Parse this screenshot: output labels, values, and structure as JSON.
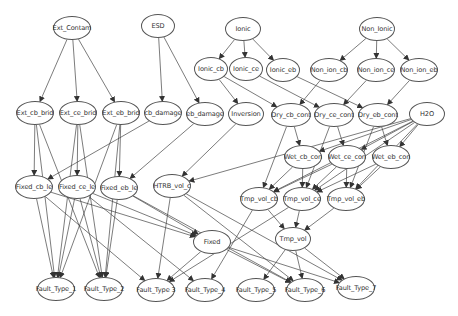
{
  "diagram": {
    "type": "directed-graph",
    "nodes": [
      {
        "id": "Ext_Contam",
        "label": "Ext_Contam",
        "x": 72,
        "y": 28,
        "w": 38,
        "h": 24
      },
      {
        "id": "ESD",
        "label": "ESD",
        "x": 158,
        "y": 26,
        "w": 34,
        "h": 24
      },
      {
        "id": "Ionic",
        "label": "Ionic",
        "x": 243,
        "y": 29,
        "w": 36,
        "h": 24
      },
      {
        "id": "Non_Ionic",
        "label": "Non_Ionic",
        "x": 377,
        "y": 29,
        "w": 36,
        "h": 24
      },
      {
        "id": "Ionic_cb",
        "label": "Ionic_cb",
        "x": 211,
        "y": 69,
        "w": 34,
        "h": 24
      },
      {
        "id": "Ionic_ce",
        "label": "Ionic_ce",
        "x": 246,
        "y": 69,
        "w": 34,
        "h": 24
      },
      {
        "id": "Ionic_eb",
        "label": "Ionic_eb",
        "x": 283,
        "y": 70,
        "w": 34,
        "h": 24
      },
      {
        "id": "Non_ion_cb",
        "label": "Non_ion_cb",
        "x": 329,
        "y": 70,
        "w": 38,
        "h": 24
      },
      {
        "id": "Non_ion_ce",
        "label": "Non_ion_ce",
        "x": 376,
        "y": 70,
        "w": 38,
        "h": 24
      },
      {
        "id": "Non_ion_eb",
        "label": "Non_ion_eb",
        "x": 419,
        "y": 70,
        "w": 38,
        "h": 24
      },
      {
        "id": "Ext_cb_brid",
        "label": "Ext_cb_brid",
        "x": 35,
        "y": 113,
        "w": 38,
        "h": 24
      },
      {
        "id": "Ext_ce_brid",
        "label": "Ext_ce_brid",
        "x": 78,
        "y": 113,
        "w": 38,
        "h": 24
      },
      {
        "id": "Ext_eb_brid",
        "label": "Ext_eb_brid",
        "x": 121,
        "y": 113,
        "w": 38,
        "h": 24
      },
      {
        "id": "cb_damage",
        "label": "cb_damage",
        "x": 163,
        "y": 113,
        "w": 38,
        "h": 24
      },
      {
        "id": "eb_damage",
        "label": "eb_damage",
        "x": 205,
        "y": 114,
        "w": 38,
        "h": 24
      },
      {
        "id": "Inversion",
        "label": "Inversion",
        "x": 246,
        "y": 114,
        "w": 36,
        "h": 24
      },
      {
        "id": "Dry_cb_cont",
        "label": "Dry_cb_cont",
        "x": 291,
        "y": 115,
        "w": 40,
        "h": 24
      },
      {
        "id": "Dry_ce_cont",
        "label": "Dry_ce_cont",
        "x": 334,
        "y": 115,
        "w": 40,
        "h": 24
      },
      {
        "id": "Dry_eb_cont",
        "label": "Dry_eb_cont",
        "x": 378,
        "y": 115,
        "w": 40,
        "h": 24
      },
      {
        "id": "H2O",
        "label": "H2O",
        "x": 427,
        "y": 114,
        "w": 36,
        "h": 24
      },
      {
        "id": "Wet_cb_con",
        "label": "Wet_cb_con",
        "x": 303,
        "y": 157,
        "w": 38,
        "h": 24
      },
      {
        "id": "Wet_ce_con",
        "label": "Wet_ce_con",
        "x": 347,
        "y": 157,
        "w": 38,
        "h": 24
      },
      {
        "id": "Wet_eb_con",
        "label": "Wet_eb_con",
        "x": 391,
        "y": 157,
        "w": 38,
        "h": 24
      },
      {
        "id": "Fixed_cb_le",
        "label": "Fixed_cb_le",
        "x": 34,
        "y": 187,
        "w": 38,
        "h": 24
      },
      {
        "id": "Fixed_ce_le",
        "label": "Fixed_ce_le",
        "x": 77,
        "y": 187,
        "w": 38,
        "h": 24
      },
      {
        "id": "Fixed_eb_le",
        "label": "Fixed_eb_le",
        "x": 119,
        "y": 188,
        "w": 38,
        "h": 24
      },
      {
        "id": "HTRB_vol_c",
        "label": "HTRB_vol_c",
        "x": 172,
        "y": 186,
        "w": 38,
        "h": 24
      },
      {
        "id": "Tmp_vol_cb",
        "label": "Tmp_vol_cb",
        "x": 259,
        "y": 199,
        "w": 38,
        "h": 24
      },
      {
        "id": "Tmp_vol_ce",
        "label": "Tmp_vol_ce",
        "x": 302,
        "y": 199,
        "w": 38,
        "h": 24
      },
      {
        "id": "Tmp_vol_eb",
        "label": "Tmp_vol_eb",
        "x": 346,
        "y": 199,
        "w": 38,
        "h": 24
      },
      {
        "id": "Fixed",
        "label": "Fixed",
        "x": 212,
        "y": 242,
        "w": 38,
        "h": 24
      },
      {
        "id": "Tmp_vol",
        "label": "Tmp_vol",
        "x": 293,
        "y": 239,
        "w": 36,
        "h": 24
      },
      {
        "id": "Fault_Type_1",
        "label": "Fault_Type_1",
        "x": 56,
        "y": 289,
        "w": 38,
        "h": 24
      },
      {
        "id": "Fault_Type_2",
        "label": "Fault_Type_2",
        "x": 104,
        "y": 289,
        "w": 38,
        "h": 24
      },
      {
        "id": "Fault_Type_3",
        "label": "Fault_Type 3",
        "x": 156,
        "y": 290,
        "w": 38,
        "h": 24
      },
      {
        "id": "Fault_Type_4",
        "label": "Fault_Type_4",
        "x": 205,
        "y": 290,
        "w": 38,
        "h": 24
      },
      {
        "id": "Fault_Type_5",
        "label": "Fault_Type_5",
        "x": 256,
        "y": 290,
        "w": 38,
        "h": 24
      },
      {
        "id": "Fault_Type_6",
        "label": "Fault_Type_6",
        "x": 305,
        "y": 290,
        "w": 38,
        "h": 24
      },
      {
        "id": "Fault_Type_7",
        "label": "Fault_Type_7",
        "x": 356,
        "y": 288,
        "w": 38,
        "h": 24
      }
    ],
    "edges": [
      [
        "Ext_Contam",
        "Ext_cb_brid"
      ],
      [
        "Ext_Contam",
        "Ext_ce_brid"
      ],
      [
        "Ext_Contam",
        "Ext_eb_brid"
      ],
      [
        "ESD",
        "cb_damage"
      ],
      [
        "ESD",
        "eb_damage"
      ],
      [
        "Ionic",
        "Ionic_cb"
      ],
      [
        "Ionic",
        "Ionic_ce"
      ],
      [
        "Ionic",
        "Ionic_eb"
      ],
      [
        "Non_Ionic",
        "Non_ion_cb"
      ],
      [
        "Non_Ionic",
        "Non_ion_ce"
      ],
      [
        "Non_Ionic",
        "Non_ion_eb"
      ],
      [
        "Ionic_cb",
        "Inversion"
      ],
      [
        "Ionic_cb",
        "Dry_cb_cont"
      ],
      [
        "Ionic_ce",
        "Dry_ce_cont"
      ],
      [
        "Ionic_eb",
        "Dry_eb_cont"
      ],
      [
        "Non_ion_cb",
        "Dry_cb_cont"
      ],
      [
        "Non_ion_ce",
        "Dry_ce_cont"
      ],
      [
        "Non_ion_eb",
        "Dry_eb_cont"
      ],
      [
        "Dry_cb_cont",
        "Wet_cb_con"
      ],
      [
        "Dry_cb_cont",
        "Tmp_vol_cb"
      ],
      [
        "Dry_ce_cont",
        "Wet_ce_con"
      ],
      [
        "Dry_ce_cont",
        "Tmp_vol_ce"
      ],
      [
        "Dry_eb_cont",
        "Wet_eb_con"
      ],
      [
        "Dry_eb_cont",
        "Tmp_vol_eb"
      ],
      [
        "H2O",
        "Wet_cb_con"
      ],
      [
        "H2O",
        "Wet_ce_con"
      ],
      [
        "H2O",
        "Wet_eb_con"
      ],
      [
        "H2O",
        "Tmp_vol_cb"
      ],
      [
        "H2O",
        "Tmp_vol_ce"
      ],
      [
        "H2O",
        "Tmp_vol_eb"
      ],
      [
        "H2O",
        "HTRB_vol_c"
      ],
      [
        "Wet_cb_con",
        "Tmp_vol_cb"
      ],
      [
        "Wet_cb_con",
        "Tmp_vol_ce"
      ],
      [
        "Wet_ce_con",
        "Tmp_vol_cb"
      ],
      [
        "Wet_ce_con",
        "Tmp_vol_ce"
      ],
      [
        "Wet_ce_con",
        "Tmp_vol_eb"
      ],
      [
        "Wet_eb_con",
        "Tmp_vol_ce"
      ],
      [
        "Wet_eb_con",
        "Tmp_vol_eb"
      ],
      [
        "Inversion",
        "HTRB_vol_c"
      ],
      [
        "cb_damage",
        "Fixed_cb_le"
      ],
      [
        "eb_damage",
        "Fixed_eb_le"
      ],
      [
        "Ext_cb_brid",
        "Fixed_cb_le"
      ],
      [
        "Ext_cb_brid",
        "Fault_Type_1"
      ],
      [
        "Ext_cb_brid",
        "Fault_Type_2"
      ],
      [
        "Ext_ce_brid",
        "Fixed_ce_le"
      ],
      [
        "Ext_ce_brid",
        "Fault_Type_1"
      ],
      [
        "Ext_ce_brid",
        "Fault_Type_2"
      ],
      [
        "Ext_eb_brid",
        "Fixed_eb_le"
      ],
      [
        "Ext_eb_brid",
        "Fault_Type_1"
      ],
      [
        "Ext_eb_brid",
        "Fault_Type_2"
      ],
      [
        "Fixed_cb_le",
        "Fault_Type_1"
      ],
      [
        "Fixed_cb_le",
        "Fixed"
      ],
      [
        "Fixed_cb_le",
        "Fault_Type_3"
      ],
      [
        "Fixed_ce_le",
        "Fault_Type_1"
      ],
      [
        "Fixed_ce_le",
        "Fault_Type_2"
      ],
      [
        "Fixed_ce_le",
        "Fixed"
      ],
      [
        "Fixed_ce_le",
        "Fault_Type_4"
      ],
      [
        "Fixed_eb_le",
        "Fault_Type_2"
      ],
      [
        "Fixed_eb_le",
        "Fixed"
      ],
      [
        "Fixed_eb_le",
        "Fault_Type_6"
      ],
      [
        "HTRB_vol_c",
        "Fault_Type_3"
      ],
      [
        "HTRB_vol_c",
        "Fault_Type_6"
      ],
      [
        "HTRB_vol_c",
        "Fault_Type_7"
      ],
      [
        "Fixed",
        "Fault_Type_3"
      ],
      [
        "Fixed",
        "Fault_Type_6"
      ],
      [
        "Fixed",
        "Fault_Type_7"
      ],
      [
        "Tmp_vol_cb",
        "Tmp_vol"
      ],
      [
        "Tmp_vol_cb",
        "Fault_Type_4"
      ],
      [
        "Tmp_vol_ce",
        "Tmp_vol"
      ],
      [
        "Tmp_vol_ce",
        "Fault_Type_3"
      ],
      [
        "Tmp_vol_eb",
        "Tmp_vol"
      ],
      [
        "Tmp_vol",
        "Fault_Type_5"
      ],
      [
        "Tmp_vol",
        "Fault_Type_6"
      ],
      [
        "Tmp_vol",
        "Fault_Type_7"
      ]
    ],
    "colors": {
      "edge": "#444444",
      "node_border": "#555555",
      "node_fill": "#ffffff",
      "text": "#333333"
    }
  }
}
